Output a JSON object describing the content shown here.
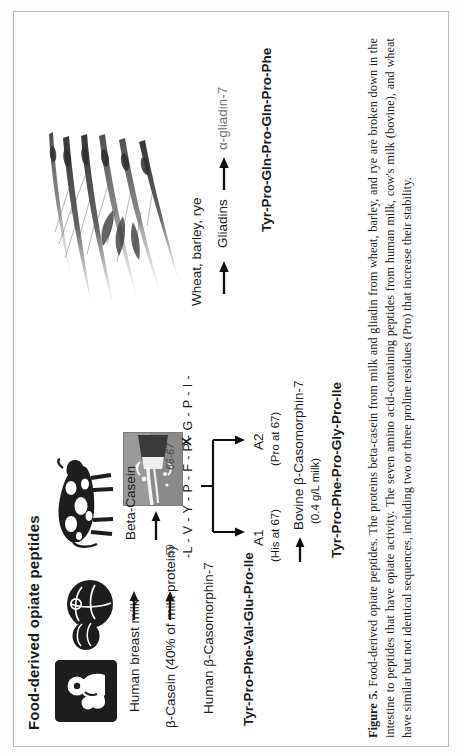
{
  "figure": {
    "title": "Food-derived opiate peptides",
    "caption_label": "Figure 5.",
    "caption_text": "Food-derived opiate peptides. The proteins beta-casein from milk and gliadin from wheat, barley, and rye are broken down in the intestine to peptides that have opiate activity. The seven amino acid-containing peptides from human milk, cow's milk (bovine), and wheat have similar but not identical sequences, including two or three proline residues (Pro) that increase their stability."
  },
  "human_branch": {
    "source_label": "Human breast milk",
    "protein_label": "β-Casein (40% of milk protein)",
    "peptide_label": "Human β-Casomorphin-7",
    "sequence": "Tyr-Pro-Phe-Val-Glu-Pro-Ile",
    "icon_breastfeeding": "breastfeeding-icon",
    "icon_breast": "breast-illustration"
  },
  "bovine_branch": {
    "source_label": "Beta-Casein",
    "icon_cow": "cow-illustration",
    "icon_milk_photo": "milk-splash-photo",
    "residue_start": "59",
    "residue_end": "66-67",
    "sequence_chain": "-L - V - Y - P - F - P - G - P - I -",
    "variable_residue": "X",
    "variant_a1": "A1",
    "variant_a1_note": "(His at 67)",
    "variant_a2": "A2",
    "variant_a2_note": "(Pro at 67)",
    "peptide_label": "Bovine β-Casomorphin-7",
    "peptide_amount": "(0.4 g/L milk)",
    "sequence": "Tyr-Pro-Phe-Pro-Gly-Pro-Ile"
  },
  "grain_branch": {
    "source_label": "Wheat, barley, rye",
    "protein_label": "Gliadins",
    "peptide_label": "α-gliadin-7",
    "sequence": "Tyr-Pro-Gln-Pro-Gln-Pro-Phe",
    "icon_wheat": "wheat-stalks-illustration"
  },
  "colors": {
    "ink": "#1a1a1a",
    "grey_text": "#6f6f6f",
    "frame": "#b9b9b9",
    "artwork_dark": "#1d1d1d",
    "photo_grey": "#8e8e8e"
  }
}
